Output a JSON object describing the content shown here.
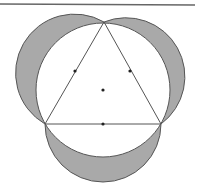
{
  "diagram": {
    "colors": {
      "stroke": "#555555",
      "shade": "#a9a9a9",
      "background": "#ffffff",
      "dot": "#222222"
    },
    "vertices": {
      "top": [
        104,
        22
      ],
      "bottom_left": [
        45,
        124
      ],
      "bottom_right": [
        161,
        124
      ]
    },
    "circumcircle": {
      "center": [
        103,
        90
      ],
      "radius": 67
    },
    "midpoints": [
      [
        74.5,
        73
      ],
      [
        132.5,
        73
      ],
      [
        103,
        124
      ]
    ],
    "center_dot": [
      103,
      91
    ]
  }
}
